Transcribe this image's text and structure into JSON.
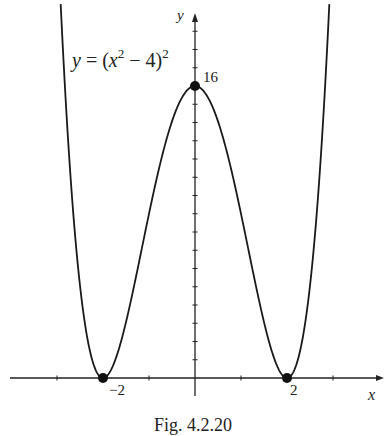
{
  "chart_data": {
    "type": "line",
    "title": "",
    "function": "y = (x^2 - 4)^2",
    "equation_label": {
      "y": "y",
      "eq": " = (",
      "x": "x",
      "sup1": "2",
      "minus": " − 4)",
      "sup2": "2"
    },
    "xlabel": "x",
    "ylabel": "y",
    "xlim": [
      -4.1,
      4.1
    ],
    "ylim": [
      0,
      20
    ],
    "x_ticks": [
      -3,
      -2,
      -1,
      1,
      2,
      3
    ],
    "x_tick_labels": [
      {
        "x": -2,
        "label": "−2"
      },
      {
        "x": 2,
        "label": "2"
      }
    ],
    "y_ticks": [
      1,
      2,
      3,
      4,
      5,
      6,
      7,
      8,
      9,
      10,
      11,
      12,
      13,
      14,
      15,
      16,
      17,
      18,
      19
    ],
    "y_tick_labels": [
      {
        "y": 16,
        "label": "16"
      }
    ],
    "points": [
      {
        "x": -2,
        "y": 0,
        "label": "−2"
      },
      {
        "x": 0,
        "y": 16,
        "label": "16"
      },
      {
        "x": 2,
        "y": 0,
        "label": "2"
      }
    ],
    "x_domain": [
      -2.92,
      2.92
    ],
    "grid": false,
    "legend": null,
    "caption": "Fig.  4.2.20"
  },
  "caption": "Fig.  4.2.20"
}
